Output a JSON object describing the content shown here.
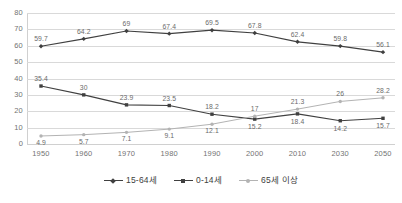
{
  "chart_data": {
    "type": "line",
    "title": "",
    "subtitle": "",
    "xlabel": "",
    "ylabel": "",
    "categories": [
      "1950",
      "1960",
      "1970",
      "1980",
      "1990",
      "2000",
      "2010",
      "2030",
      "2050"
    ],
    "ylim": [
      0,
      80
    ],
    "ytick_step": 10,
    "yticks": [
      "80",
      "70",
      "60",
      "50",
      "40",
      "30",
      "20",
      "10",
      "0"
    ],
    "grid": "horizontal",
    "legend_position": "bottom",
    "series": [
      {
        "name": "15-64세",
        "color": "#404040",
        "marker": "diamond",
        "values": [
          59.7,
          64.2,
          69,
          67.4,
          69.5,
          67.8,
          62.4,
          59.8,
          56.1
        ],
        "labels": [
          "59.7",
          "64.2",
          "69",
          "67.4",
          "69.5",
          "67.8",
          "62.4",
          "59.8",
          "56.1"
        ]
      },
      {
        "name": "0-14세",
        "color": "#404040",
        "marker": "square",
        "values": [
          35.4,
          30,
          23.9,
          23.5,
          18.2,
          15.2,
          18.4,
          14.2,
          15.7
        ],
        "labels": [
          "35.4",
          "30",
          "23.9",
          "23.5",
          "18.2",
          "15.2",
          "18.4",
          "14.2",
          "15.7"
        ]
      },
      {
        "name": "65세 이상",
        "color": "#b3b3b3",
        "marker": "circle",
        "values": [
          4.9,
          5.7,
          7.1,
          9.1,
          12.1,
          17,
          21.3,
          26,
          28.2
        ],
        "labels": [
          "4.9",
          "5.7",
          "7.1",
          "9.1",
          "12.1",
          "17",
          "21.3",
          "26",
          "28.2"
        ]
      }
    ]
  },
  "legend": {
    "items": [
      {
        "label": "15-64세"
      },
      {
        "label": "0-14세"
      },
      {
        "label": "65세 이상"
      }
    ]
  },
  "colors": {
    "dark_series": "#404040",
    "light_series": "#b3b3b3",
    "gridline": "#d9d9d9",
    "axis_text": "#737373",
    "label_text": "#6b6b6b",
    "background": "#ffffff"
  }
}
